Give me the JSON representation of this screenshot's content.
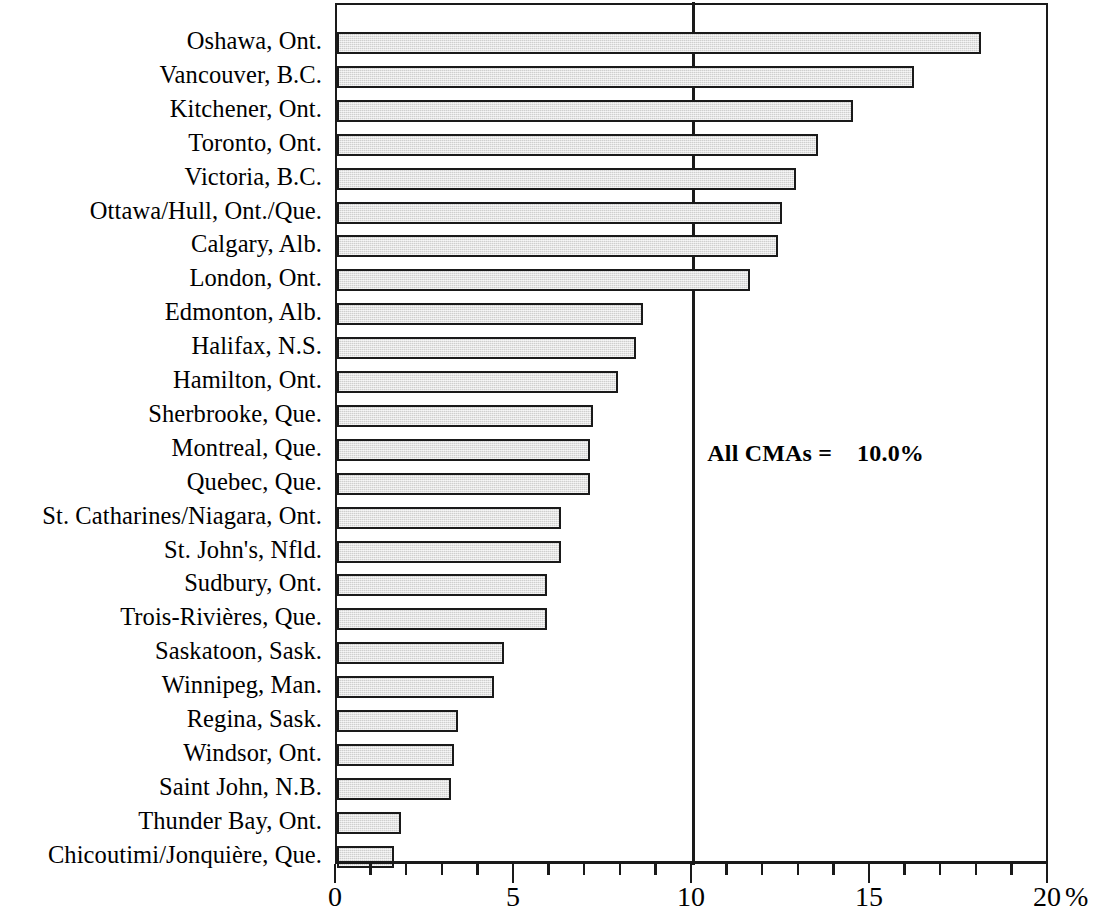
{
  "chart_data": {
    "type": "bar",
    "orientation": "horizontal",
    "title": "",
    "subtitle": "",
    "xlabel": "%",
    "ylabel": "",
    "xlim": [
      0,
      20
    ],
    "ylim": null,
    "grid": false,
    "legend": null,
    "x_major_ticks": [
      0,
      5,
      10,
      15,
      20
    ],
    "x_tick_labels": [
      "0",
      "5",
      "10",
      "15",
      "20"
    ],
    "x_minor_tick_step": 1,
    "bar_fill_color": "#dededd",
    "bar_edge_color": "#1a1a1a",
    "annotations": [
      {
        "text": "All CMAs =    10.0%",
        "x": 10.4,
        "y_category_index": 12,
        "style": "bold"
      }
    ],
    "reference_line": {
      "value": 10.0,
      "label": "All CMAs = 10.0%",
      "color": "#1a1a1a"
    },
    "categories": [
      "Oshawa, Ont.",
      "Vancouver, B.C.",
      "Kitchener, Ont.",
      "Toronto, Ont.",
      "Victoria, B.C.",
      "Ottawa/Hull,  Ont./Que.",
      "Calgary, Alb.",
      "London, Ont.",
      "Edmonton, Alb.",
      "Halifax, N.S.",
      "Hamilton, Ont.",
      "Sherbrooke, Que.",
      "Montreal, Que.",
      "Quebec, Que.",
      "St. Catharines/Niagara, Ont.",
      "St. John's, Nfld.",
      "Sudbury, Ont.",
      "Trois-Rivières, Que.",
      "Saskatoon, Sask.",
      "Winnipeg, Man.",
      "Regina, Sask.",
      "Windsor, Ont.",
      "Saint John, N.B.",
      "Thunder Bay, Ont.",
      "Chicoutimi/Jonquière, Que."
    ],
    "values": [
      18.1,
      16.2,
      14.5,
      13.5,
      12.9,
      12.5,
      12.4,
      11.6,
      8.6,
      8.4,
      7.9,
      7.2,
      7.1,
      7.1,
      6.3,
      6.3,
      5.9,
      5.9,
      4.7,
      4.4,
      3.4,
      3.3,
      3.2,
      1.8,
      1.6
    ]
  }
}
